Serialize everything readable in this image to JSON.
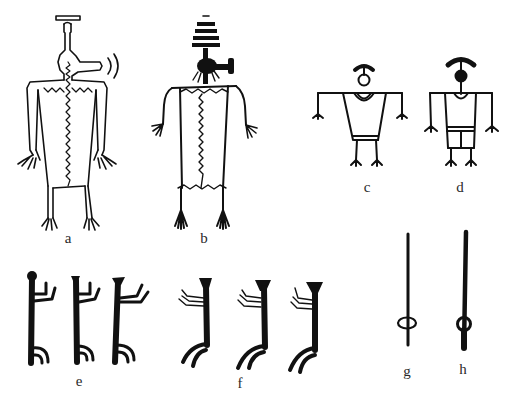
{
  "figure": {
    "ink_color": "#111111",
    "background": "#ffffff",
    "panels": [
      {
        "id": "a",
        "label": "a",
        "description": "outlined anthropomorph with headdress bar, side-projecting snout and sound arcs, zigzag center line"
      },
      {
        "id": "b",
        "label": "b",
        "description": "anthropomorph with striped conical headdress, hammer-like head projection, zigzag body lines"
      },
      {
        "id": "c",
        "label": "c",
        "description": "stick figure with open-circle head, arched headdress, trapezoid tunic with waistband"
      },
      {
        "id": "d",
        "label": "d",
        "description": "stick figure with solid-circle head, arched headdress, rectangular tunic with kilt"
      },
      {
        "id": "e",
        "label": "e",
        "description": "three solid-line figures facing right with raised arms and hooked legs"
      },
      {
        "id": "f",
        "label": "f",
        "description": "three solid-line figures facing left with flared heads, raised double-line arms and curved legs"
      },
      {
        "id": "g",
        "label": "g",
        "description": "thin vertical staff with looped knot near base"
      },
      {
        "id": "h",
        "label": "h",
        "description": "thicker vertical staff with ring near base"
      }
    ]
  }
}
